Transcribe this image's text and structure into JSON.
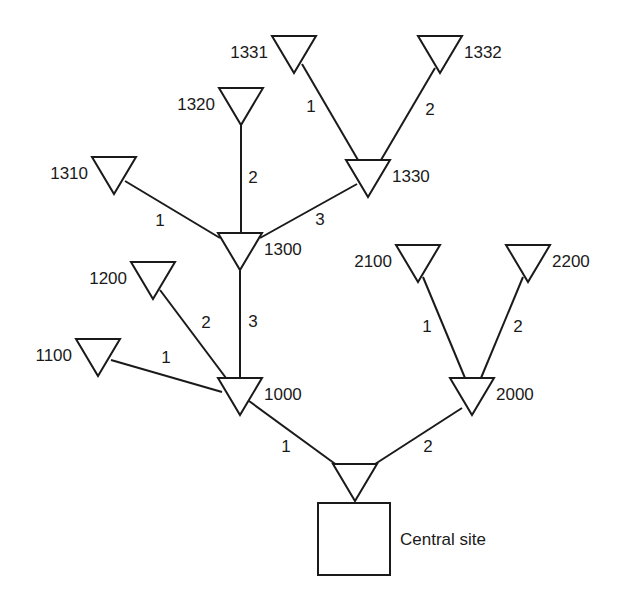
{
  "diagram": {
    "type": "tree-network",
    "central_site": {
      "label": "Central site",
      "box": {
        "x": 318,
        "y": 503,
        "w": 72,
        "h": 72
      }
    },
    "nodes": [
      {
        "id": "central",
        "label": "",
        "x": 355,
        "y": 464,
        "label_side": "none"
      },
      {
        "id": "1000",
        "label": "1000",
        "x": 240,
        "y": 378,
        "label_side": "right"
      },
      {
        "id": "2000",
        "label": "2000",
        "x": 472,
        "y": 378,
        "label_side": "right"
      },
      {
        "id": "1100",
        "label": "1100",
        "x": 98,
        "y": 339,
        "label_side": "left"
      },
      {
        "id": "1200",
        "label": "1200",
        "x": 153,
        "y": 262,
        "label_side": "left"
      },
      {
        "id": "1300",
        "label": "1300",
        "x": 240,
        "y": 233,
        "label_side": "right"
      },
      {
        "id": "1310",
        "label": "1310",
        "x": 114,
        "y": 157,
        "label_side": "left"
      },
      {
        "id": "1320",
        "label": "1320",
        "x": 241,
        "y": 88,
        "label_side": "left"
      },
      {
        "id": "1330",
        "label": "1330",
        "x": 368,
        "y": 160,
        "label_side": "right"
      },
      {
        "id": "1331",
        "label": "1331",
        "x": 294,
        "y": 36,
        "label_side": "left"
      },
      {
        "id": "1332",
        "label": "1332",
        "x": 440,
        "y": 36,
        "label_side": "right"
      },
      {
        "id": "2100",
        "label": "2100",
        "x": 418,
        "y": 245,
        "label_side": "left"
      },
      {
        "id": "2200",
        "label": "2200",
        "x": 528,
        "y": 245,
        "label_side": "right"
      }
    ],
    "edges": [
      {
        "from": "central",
        "to": "1000",
        "label": "1",
        "x1": 338,
        "y1": 466,
        "x2": 249,
        "y2": 401,
        "lx": 286,
        "ly": 452
      },
      {
        "from": "central",
        "to": "2000",
        "label": "2",
        "x1": 372,
        "y1": 466,
        "x2": 462,
        "y2": 408,
        "lx": 428,
        "ly": 452
      },
      {
        "from": "1000",
        "to": "1100",
        "label": "1",
        "x1": 222,
        "y1": 392,
        "x2": 111,
        "y2": 360,
        "lx": 166,
        "ly": 363
      },
      {
        "from": "1000",
        "to": "1200",
        "label": "2",
        "x1": 226,
        "y1": 378,
        "x2": 160,
        "y2": 290,
        "lx": 206,
        "ly": 328
      },
      {
        "from": "1000",
        "to": "1300",
        "label": "3",
        "x1": 240,
        "y1": 378,
        "x2": 240,
        "y2": 268,
        "lx": 253,
        "ly": 327
      },
      {
        "from": "1300",
        "to": "1310",
        "label": "1",
        "x1": 220,
        "y1": 238,
        "x2": 125,
        "y2": 181,
        "lx": 160,
        "ly": 226
      },
      {
        "from": "1300",
        "to": "1320",
        "label": "2",
        "x1": 241,
        "y1": 233,
        "x2": 241,
        "y2": 124,
        "lx": 253,
        "ly": 183
      },
      {
        "from": "1300",
        "to": "1330",
        "label": "3",
        "x1": 260,
        "y1": 238,
        "x2": 357,
        "y2": 184,
        "lx": 320,
        "ly": 225
      },
      {
        "from": "1330",
        "to": "1331",
        "label": "1",
        "x1": 358,
        "y1": 160,
        "x2": 302,
        "y2": 64,
        "lx": 311,
        "ly": 112
      },
      {
        "from": "1330",
        "to": "1332",
        "label": "2",
        "x1": 381,
        "y1": 160,
        "x2": 435,
        "y2": 68,
        "lx": 430,
        "ly": 115
      },
      {
        "from": "2000",
        "to": "2100",
        "label": "1",
        "x1": 465,
        "y1": 378,
        "x2": 423,
        "y2": 277,
        "lx": 427,
        "ly": 332
      },
      {
        "from": "2000",
        "to": "2200",
        "label": "2",
        "x1": 481,
        "y1": 378,
        "x2": 523,
        "y2": 277,
        "lx": 518,
        "ly": 332
      }
    ]
  },
  "colors": {
    "stroke": "#1a1a1a",
    "background": "#ffffff"
  }
}
